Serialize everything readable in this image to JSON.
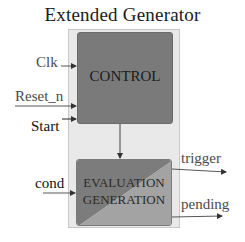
{
  "diagram": {
    "title": "Extended  Generator",
    "blocks": {
      "control": {
        "label": "CONTROL",
        "color": "#7a7a7a"
      },
      "evaluation": {
        "label_line1": "EVALUATION",
        "label_line2": "GENERATION",
        "color_dark": "#7c7c7c",
        "color_light": "#a3a3a3"
      }
    },
    "container_color": "#e9e9e9",
    "inputs": [
      {
        "id": "clk",
        "label": "Clk"
      },
      {
        "id": "reset_n",
        "label": "Reset_n"
      },
      {
        "id": "start",
        "label": "Start"
      },
      {
        "id": "cond",
        "label": "cond"
      }
    ],
    "outputs": [
      {
        "id": "trigger",
        "label": "trigger"
      },
      {
        "id": "pending",
        "label": "pending"
      }
    ]
  }
}
